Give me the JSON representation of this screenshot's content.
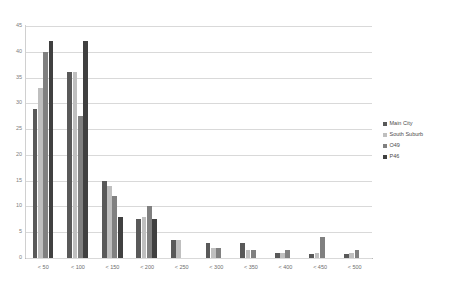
{
  "title": "",
  "chart_data": {
    "type": "bar",
    "title": "",
    "subtitle": "",
    "xlabel": "",
    "ylabel": "",
    "ylim": [
      0,
      45
    ],
    "ytick_step": 5,
    "yticks": [
      0,
      5,
      10,
      15,
      20,
      25,
      30,
      35,
      40,
      45
    ],
    "grid": true,
    "legend_position": "right",
    "categories": [
      "< 50",
      "< 100",
      "< 150",
      "< 200",
      "< 250",
      "< 300",
      "< 350",
      "< 400",
      "< 450",
      "< 500"
    ],
    "series": [
      {
        "name": "Main City",
        "color": "#595959",
        "values": [
          29,
          36,
          15,
          7.5,
          3.5,
          3,
          3,
          1,
          0.7,
          0.7
        ]
      },
      {
        "name": "South Suburb",
        "color": "#BFBFBF",
        "values": [
          33,
          36,
          14,
          8,
          3.5,
          2,
          1.5,
          1,
          1,
          1
        ]
      },
      {
        "name": "O49",
        "color": "#808080",
        "values": [
          40,
          27.5,
          12,
          10,
          0,
          2,
          1.5,
          1.5,
          4,
          1.5
        ]
      },
      {
        "name": "P46",
        "color": "#404040",
        "values": [
          42,
          42,
          8,
          7.5,
          0,
          0,
          0,
          0,
          0,
          0
        ]
      }
    ]
  },
  "legend": {
    "items": [
      {
        "label": "Main City",
        "color": "#595959"
      },
      {
        "label": "South Suburb",
        "color": "#BFBFBF"
      },
      {
        "label": "O49",
        "color": "#808080"
      },
      {
        "label": "P46",
        "color": "#404040"
      }
    ]
  },
  "axis": {
    "y_labels": [
      "45",
      "40",
      "35",
      "30",
      "25",
      "20",
      "15",
      "10",
      "5",
      "0"
    ],
    "x_labels": [
      "< 50",
      "< 100",
      "< 150",
      "< 200",
      "< 250",
      "< 300",
      "< 350",
      "< 400",
      "< 450",
      "< 500"
    ]
  }
}
